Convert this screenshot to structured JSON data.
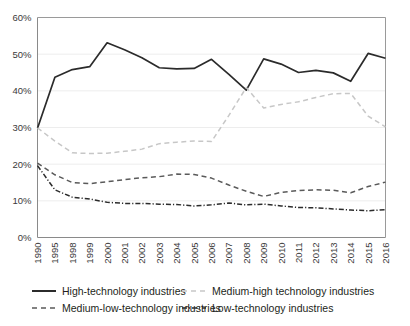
{
  "chart_data": {
    "type": "line",
    "title": "",
    "xlabel": "",
    "ylabel": "",
    "ylim": [
      0,
      60
    ],
    "ytick_labels": [
      "0%",
      "10%",
      "20%",
      "30%",
      "40%",
      "50%",
      "60%"
    ],
    "ytick_values": [
      0,
      10,
      20,
      30,
      40,
      50,
      60
    ],
    "grid": true,
    "grid_axis": "y",
    "legend_position": "bottom",
    "categories": [
      "1990",
      "1995",
      "1998",
      "1999",
      "2000",
      "2001",
      "2002",
      "2003",
      "2004",
      "2005",
      "2006",
      "2007",
      "2008",
      "2009",
      "2010",
      "2011",
      "2012",
      "2013",
      "2014",
      "2015",
      "2016"
    ],
    "series": [
      {
        "name": "High-technology industries",
        "style": "solid",
        "color": "#2b2b2b",
        "values": [
          29.8,
          43.7,
          45.8,
          46.6,
          53.1,
          51.2,
          49.0,
          46.3,
          46.0,
          46.1,
          48.6,
          44.5,
          40.2,
          48.7,
          47.3,
          45.0,
          45.6,
          44.9,
          42.6,
          50.2,
          48.9
        ]
      },
      {
        "name": "Medium-high technology industries",
        "style": "dashed-light",
        "color": "#c7c7c7",
        "values": [
          29.9,
          26.3,
          23.1,
          22.9,
          23.0,
          23.5,
          24.1,
          25.6,
          26.0,
          26.3,
          26.2,
          33.3,
          40.9,
          35.3,
          36.3,
          37.0,
          38.2,
          39.2,
          39.3,
          33.1,
          30.2
        ]
      },
      {
        "name": "Medium-low-technology industries",
        "style": "dashed-dark",
        "color": "#5a5a5a",
        "values": [
          20.3,
          17.1,
          15.0,
          14.7,
          15.2,
          15.8,
          16.3,
          16.6,
          17.3,
          17.2,
          16.2,
          14.3,
          12.6,
          11.2,
          12.3,
          12.8,
          13.0,
          12.9,
          12.2,
          13.9,
          15.1
        ]
      },
      {
        "name": "Low-technology industries",
        "style": "dash-dot",
        "color": "#2b2b2b",
        "values": [
          19.6,
          13.0,
          11.0,
          10.5,
          9.6,
          9.3,
          9.3,
          9.1,
          9.0,
          8.6,
          8.9,
          9.4,
          8.9,
          9.1,
          8.6,
          8.2,
          8.1,
          7.8,
          7.5,
          7.3,
          7.6
        ]
      }
    ]
  },
  "legend": {
    "items": [
      {
        "label": "High-technology industries"
      },
      {
        "label": "Medium-high technology industries"
      },
      {
        "label": "Medium-low-technology industries"
      },
      {
        "label": "Low-technology industries"
      }
    ]
  }
}
